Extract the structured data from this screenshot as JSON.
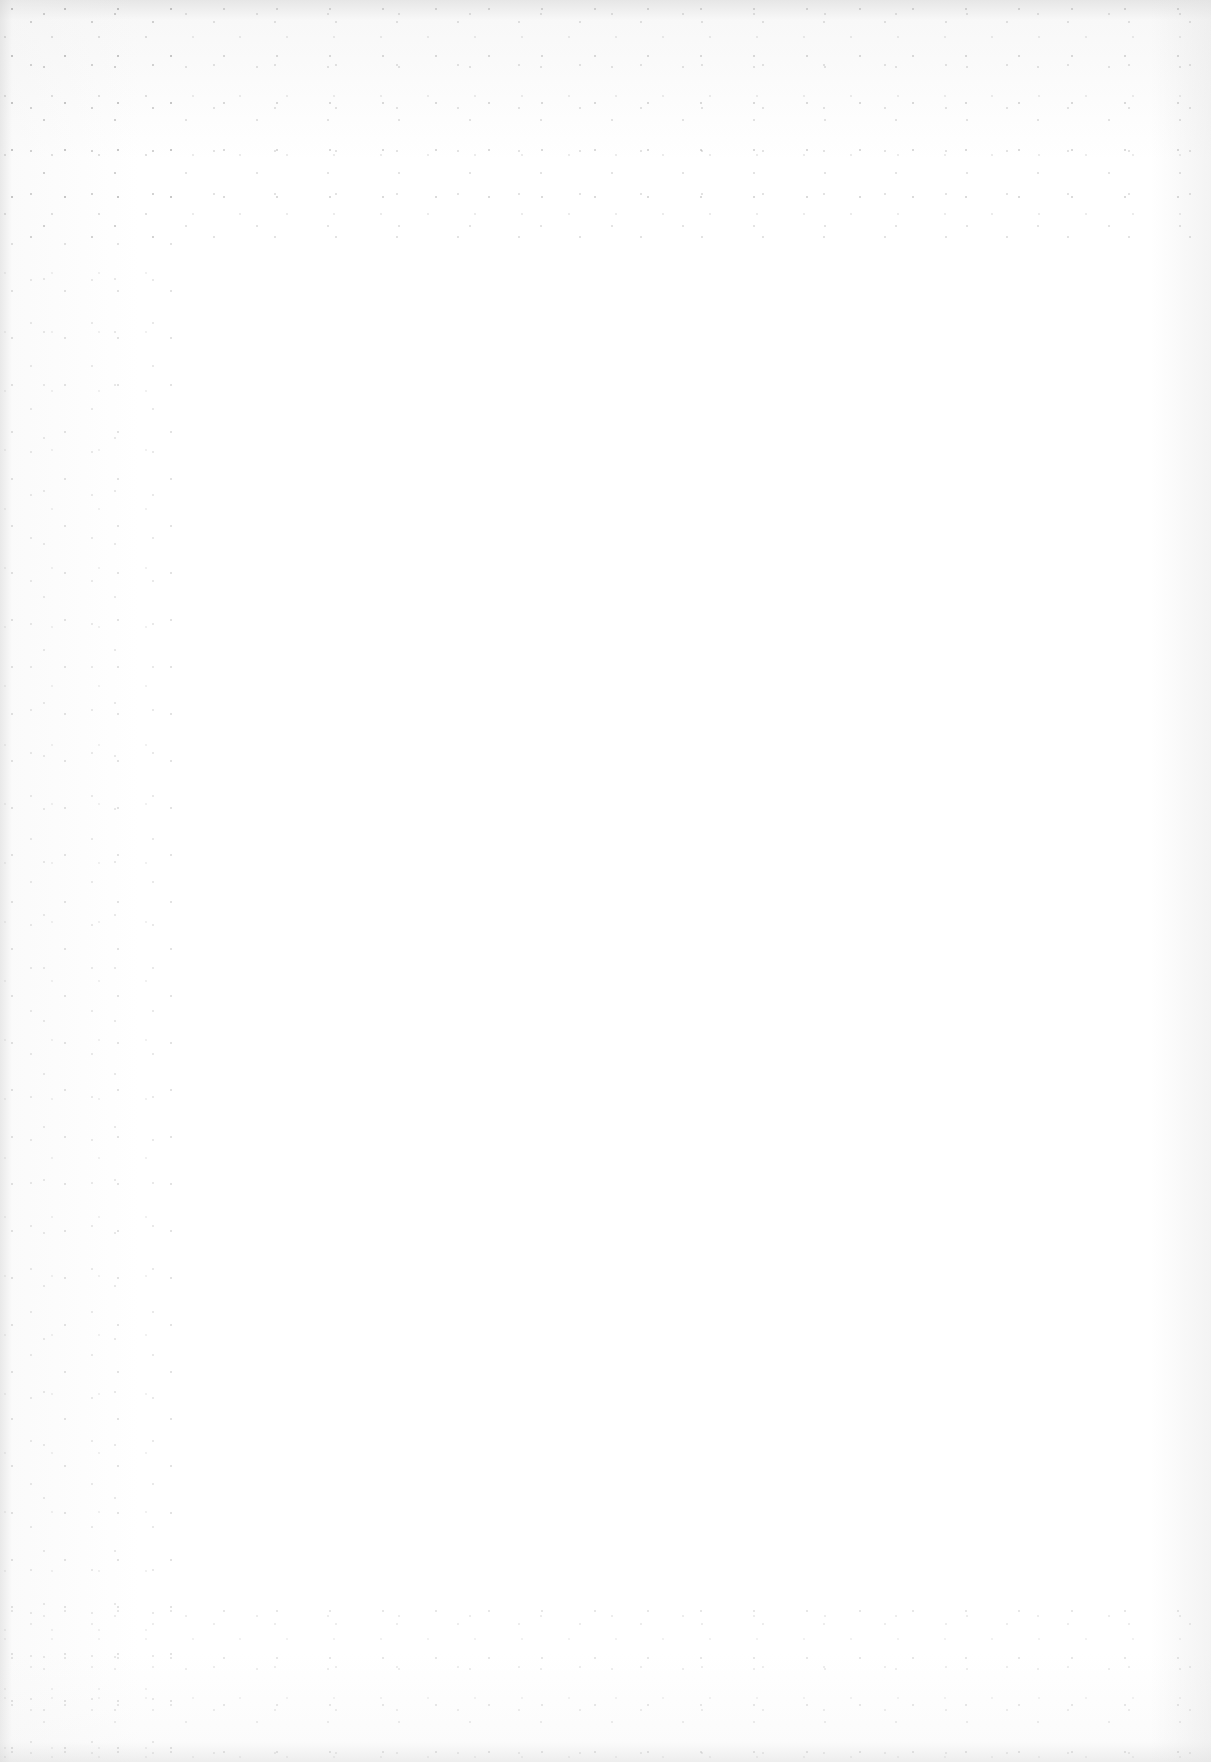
{
  "document": {
    "page_type": "blank scanned page",
    "content": "",
    "background_color": "#ffffff",
    "edge_shading_color": "#d2d2d2",
    "speckle_color": "#8c8c8c"
  }
}
